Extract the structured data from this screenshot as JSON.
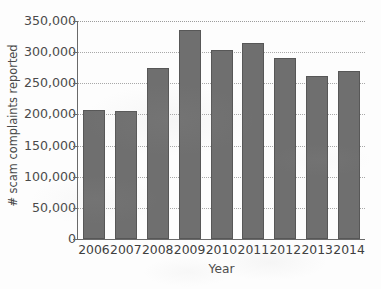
{
  "chart_data": {
    "type": "bar",
    "title": "",
    "xlabel": "Year",
    "ylabel": "# scam complaints reported",
    "categories": [
      "2006",
      "2007",
      "2008",
      "2009",
      "2010",
      "2011",
      "2012",
      "2013",
      "2014"
    ],
    "values": [
      207000,
      206000,
      275000,
      336000,
      303000,
      314000,
      290000,
      262000,
      269000
    ],
    "series": [
      {
        "name": "# scam complaints reported",
        "values": [
          207000,
          206000,
          275000,
          336000,
          303000,
          314000,
          290000,
          262000,
          269000
        ]
      }
    ],
    "ylim": [
      0,
      350000
    ],
    "xlim_categories": 9,
    "ytick_values": [
      0,
      50000,
      100000,
      150000,
      200000,
      250000,
      300000,
      350000
    ],
    "ytick_labels": [
      "0",
      "50,000",
      "100,000",
      "150,000",
      "200,000",
      "250,000",
      "300,000",
      "350,000"
    ],
    "xtick_labels": [
      "2006",
      "2007",
      "2008",
      "2009",
      "2010",
      "2011",
      "2012",
      "2013",
      "2014"
    ],
    "grid": true,
    "grid_orientation": "horizontal",
    "grid_style": "dotted",
    "legend": false,
    "legend_position": "none",
    "bar_color": "#6f6f6f",
    "bar_edge_color": "#575757",
    "axis_color": "#6a6a6a",
    "gridline_color": "#a8a8a8",
    "background_color": "#fdfdfd",
    "annotations": []
  }
}
